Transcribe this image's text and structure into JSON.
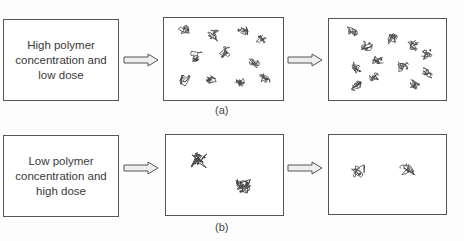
{
  "figure": {
    "rows": [
      {
        "id": "a",
        "condition_label": "High polymer concentration and low dose",
        "caption": "(a)",
        "stage1": "many separate polymer coils",
        "stage2": "coils aggregated into ring-like clusters"
      },
      {
        "id": "b",
        "condition_label": "Low polymer concentration and high dose",
        "caption": "(b)",
        "stage1": "two compact crosslinked polymer coils",
        "stage2": "two isolated loose polymer coils"
      }
    ],
    "arrow_icon": "right-arrow-icon",
    "colors": {
      "stroke": "#555555",
      "arrow_fill": "#eeeeee",
      "coil": "#444444"
    }
  }
}
